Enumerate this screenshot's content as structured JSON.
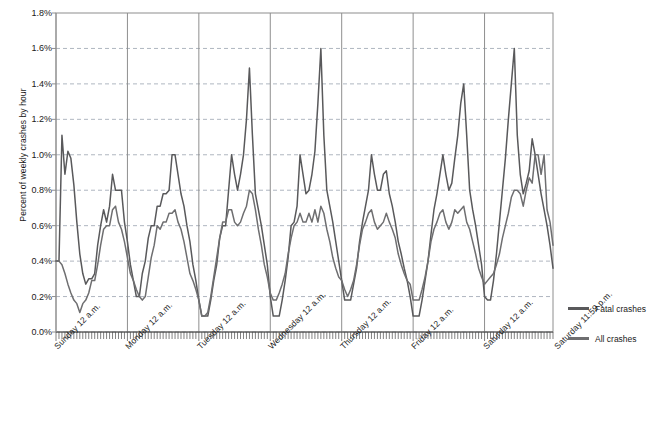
{
  "chart_data": {
    "type": "line",
    "title": "",
    "xlabel": "",
    "ylabel": "Percent of weekly crashes by hour",
    "ylim": [
      0,
      1.8
    ],
    "ytick_labels": [
      "0.0%",
      "0.2%",
      "0.4%",
      "0.6%",
      "0.8%",
      "1.0%",
      "1.2%",
      "1.4%",
      "1.6%",
      "1.8%"
    ],
    "ytick_values": [
      0.0,
      0.2,
      0.4,
      0.6,
      0.8,
      1.0,
      1.2,
      1.4,
      1.6,
      1.8
    ],
    "grid": "horizontal-dashed",
    "legend_position": "right",
    "x_boundary_labels": [
      "Sunday 12 a.m.",
      "Monday 12 a.m.",
      "Tuesday 12 a.m.",
      "Wednesday 12 a.m.",
      "Thursday 12 a.m.",
      "Friday 12 a.m.",
      "Saturday 12 a.m.",
      "Saturday 11:59 p.m."
    ],
    "x_unit": "hour-of-week",
    "x_points": 168,
    "series": [
      {
        "name": "Fatal crashes",
        "color": "#59595b",
        "values": [
          0.4,
          0.4,
          1.11,
          0.89,
          1.02,
          0.98,
          0.83,
          0.62,
          0.44,
          0.33,
          0.27,
          0.3,
          0.3,
          0.33,
          0.49,
          0.6,
          0.69,
          0.62,
          0.71,
          0.89,
          0.8,
          0.8,
          0.8,
          0.62,
          0.51,
          0.38,
          0.29,
          0.2,
          0.2,
          0.33,
          0.4,
          0.53,
          0.6,
          0.6,
          0.71,
          0.71,
          0.78,
          0.78,
          0.8,
          1.0,
          1.0,
          0.89,
          0.78,
          0.71,
          0.6,
          0.51,
          0.38,
          0.29,
          0.18,
          0.09,
          0.09,
          0.09,
          0.18,
          0.29,
          0.38,
          0.53,
          0.6,
          0.6,
          0.8,
          1.0,
          0.89,
          0.8,
          0.89,
          1.0,
          1.2,
          1.49,
          1.11,
          0.78,
          0.69,
          0.6,
          0.49,
          0.38,
          0.2,
          0.09,
          0.09,
          0.09,
          0.18,
          0.29,
          0.42,
          0.6,
          0.62,
          0.71,
          1.0,
          0.89,
          0.78,
          0.8,
          0.89,
          1.02,
          1.29,
          1.6,
          1.11,
          0.8,
          0.71,
          0.62,
          0.51,
          0.4,
          0.29,
          0.18,
          0.18,
          0.18,
          0.27,
          0.36,
          0.51,
          0.62,
          0.71,
          0.8,
          1.0,
          0.89,
          0.8,
          0.8,
          0.89,
          0.91,
          0.78,
          0.71,
          0.62,
          0.51,
          0.44,
          0.36,
          0.29,
          0.2,
          0.09,
          0.09,
          0.09,
          0.18,
          0.29,
          0.4,
          0.55,
          0.69,
          0.78,
          0.89,
          1.0,
          0.89,
          0.8,
          0.84,
          0.98,
          1.11,
          1.29,
          1.4,
          1.11,
          0.8,
          0.69,
          0.6,
          0.49,
          0.38,
          0.2,
          0.18,
          0.18,
          0.29,
          0.44,
          0.62,
          0.8,
          0.98,
          1.2,
          1.4,
          1.6,
          1.11,
          0.89,
          0.78,
          0.84,
          0.91,
          1.09,
          1.0,
          0.89,
          0.78,
          0.69,
          0.6,
          0.49,
          0.36
        ]
      },
      {
        "name": "All crashes",
        "color": "#6e6e70",
        "values": [
          0.4,
          0.4,
          0.38,
          0.33,
          0.27,
          0.22,
          0.18,
          0.16,
          0.11,
          0.16,
          0.18,
          0.22,
          0.29,
          0.29,
          0.38,
          0.49,
          0.58,
          0.6,
          0.6,
          0.69,
          0.71,
          0.62,
          0.58,
          0.51,
          0.42,
          0.33,
          0.29,
          0.24,
          0.2,
          0.18,
          0.2,
          0.31,
          0.42,
          0.49,
          0.6,
          0.58,
          0.62,
          0.62,
          0.67,
          0.67,
          0.69,
          0.62,
          0.58,
          0.51,
          0.42,
          0.33,
          0.29,
          0.24,
          0.18,
          0.09,
          0.09,
          0.11,
          0.2,
          0.31,
          0.42,
          0.53,
          0.62,
          0.62,
          0.69,
          0.69,
          0.62,
          0.6,
          0.62,
          0.67,
          0.71,
          0.8,
          0.78,
          0.69,
          0.58,
          0.49,
          0.38,
          0.31,
          0.22,
          0.18,
          0.18,
          0.22,
          0.27,
          0.33,
          0.44,
          0.53,
          0.6,
          0.62,
          0.67,
          0.62,
          0.62,
          0.67,
          0.62,
          0.69,
          0.62,
          0.71,
          0.67,
          0.58,
          0.51,
          0.42,
          0.36,
          0.31,
          0.29,
          0.24,
          0.2,
          0.24,
          0.29,
          0.38,
          0.49,
          0.58,
          0.62,
          0.67,
          0.69,
          0.62,
          0.58,
          0.6,
          0.62,
          0.67,
          0.62,
          0.58,
          0.53,
          0.44,
          0.38,
          0.33,
          0.29,
          0.27,
          0.18,
          0.18,
          0.18,
          0.24,
          0.31,
          0.4,
          0.51,
          0.58,
          0.62,
          0.67,
          0.69,
          0.62,
          0.58,
          0.62,
          0.69,
          0.67,
          0.69,
          0.71,
          0.62,
          0.58,
          0.51,
          0.44,
          0.36,
          0.31,
          0.27,
          0.29,
          0.31,
          0.33,
          0.38,
          0.44,
          0.53,
          0.6,
          0.67,
          0.76,
          0.8,
          0.8,
          0.78,
          0.71,
          0.8,
          0.87,
          0.84,
          1.0,
          1.0,
          0.89,
          1.0,
          0.69,
          0.62,
          0.49
        ]
      }
    ]
  },
  "legend": {
    "items": [
      {
        "label": "Fatal crashes",
        "color": "#59595b"
      },
      {
        "label": "All crashes",
        "color": "#6e6e70"
      }
    ]
  }
}
